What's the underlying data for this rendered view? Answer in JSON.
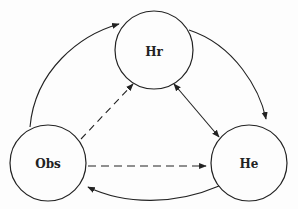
{
  "diagram": {
    "nodes": [
      {
        "id": "hr",
        "label": "Hr",
        "cx": 154,
        "cy": 50,
        "r": 39
      },
      {
        "id": "obs",
        "label": "Obs",
        "cx": 48,
        "cy": 163,
        "r": 38
      },
      {
        "id": "he",
        "label": "He",
        "cx": 249,
        "cy": 163,
        "r": 38
      }
    ],
    "edges": [
      {
        "from": "obs",
        "to": "hr",
        "style": "solid",
        "route": "outer-left-arc"
      },
      {
        "from": "hr",
        "to": "he",
        "style": "solid",
        "route": "outer-right-arc"
      },
      {
        "from": "he",
        "to": "obs",
        "style": "solid",
        "route": "bottom-arc"
      },
      {
        "from": "obs",
        "to": "hr",
        "style": "dashed",
        "route": "straight"
      },
      {
        "from": "obs",
        "to": "he",
        "style": "dashed",
        "route": "straight"
      },
      {
        "from": "hr",
        "to": "he",
        "style": "solid",
        "route": "straight",
        "bidirectional": true
      }
    ],
    "colors": {
      "stroke": "#222222",
      "background": "#fdfdfd"
    }
  }
}
